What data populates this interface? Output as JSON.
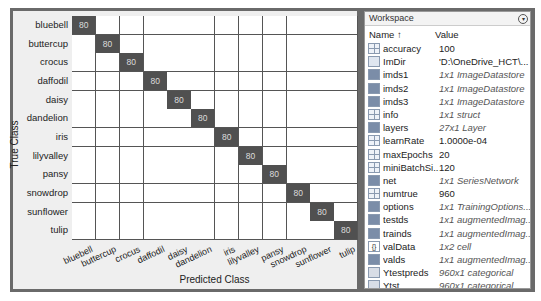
{
  "confusion_chart": {
    "x_title": "Predicted Class",
    "y_title": "True Class",
    "classes": [
      "bluebell",
      "buttercup",
      "crocus",
      "daffodil",
      "daisy",
      "dandelion",
      "iris",
      "lilyvalley",
      "pansy",
      "snowdrop",
      "sunflower",
      "tulip"
    ],
    "diagonal_value": "80",
    "cell_colors": {
      "hit": "#505050",
      "empty": "#ffffff"
    }
  },
  "workspace": {
    "title": "Workspace",
    "columns": {
      "name": "Name ↑",
      "value": "Value"
    },
    "variables": [
      {
        "name": "accuracy",
        "value": "100",
        "icon": "matrix-icon",
        "italic": false
      },
      {
        "name": "ImDir",
        "value": "'D:\\OneDrive_HCT\\...",
        "icon": "char-icon",
        "italic": false
      },
      {
        "name": "imds1",
        "value": "1x1 ImageDatastore",
        "icon": "object-icon",
        "italic": true
      },
      {
        "name": "imds2",
        "value": "1x1 ImageDatastore",
        "icon": "object-icon",
        "italic": true
      },
      {
        "name": "imds3",
        "value": "1x1 ImageDatastore",
        "icon": "object-icon",
        "italic": true
      },
      {
        "name": "info",
        "value": "1x1 struct",
        "icon": "struct-icon",
        "italic": true
      },
      {
        "name": "layers",
        "value": "27x1 Layer",
        "icon": "object-icon",
        "italic": true
      },
      {
        "name": "learnRate",
        "value": "1.0000e-04",
        "icon": "matrix-icon",
        "italic": false
      },
      {
        "name": "maxEpochs",
        "value": "20",
        "icon": "matrix-icon",
        "italic": false
      },
      {
        "name": "miniBatchSi...",
        "value": "120",
        "icon": "matrix-icon",
        "italic": false
      },
      {
        "name": "net",
        "value": "1x1 SeriesNetwork",
        "icon": "object-icon",
        "italic": true
      },
      {
        "name": "numtrue",
        "value": "960",
        "icon": "matrix-icon",
        "italic": false
      },
      {
        "name": "options",
        "value": "1x1 TrainingOptions...",
        "icon": "object-icon",
        "italic": true
      },
      {
        "name": "testds",
        "value": "1x1 augmentedImag...",
        "icon": "object-icon",
        "italic": true
      },
      {
        "name": "trainds",
        "value": "1x1 augmentedImag...",
        "icon": "object-icon",
        "italic": true
      },
      {
        "name": "valData",
        "value": "1x2 cell",
        "icon": "cell-icon",
        "italic": true
      },
      {
        "name": "valds",
        "value": "1x1 augmentedImag...",
        "icon": "object-icon",
        "italic": true
      },
      {
        "name": "Ytestpreds",
        "value": "960x1 categorical",
        "icon": "categorical-icon",
        "italic": true
      },
      {
        "name": "Ytst",
        "value": "960x1 categorical",
        "icon": "categorical-icon",
        "italic": true
      }
    ]
  }
}
